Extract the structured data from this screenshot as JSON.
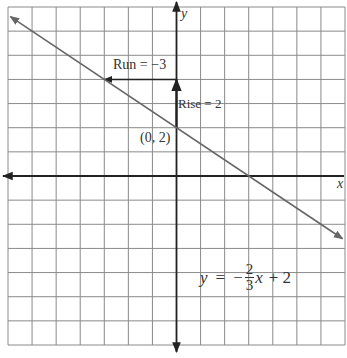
{
  "diagram": {
    "type": "coordinate-graph",
    "grid": {
      "x_min": -7,
      "x_max": 7,
      "y_min": -7,
      "y_max": 7,
      "step": 1
    },
    "axes": {
      "x_label": "x",
      "y_label": "y"
    },
    "line": {
      "slope_num": -2,
      "slope_den": 3,
      "intercept": 2,
      "color": "#666666"
    },
    "point": {
      "label": "(0, 2)",
      "x": 0,
      "y": 2
    },
    "rise": {
      "label": "Rise = 2",
      "from": [
        0,
        2
      ],
      "to": [
        0,
        4
      ]
    },
    "run": {
      "label": "Run = −3",
      "from": [
        0,
        4
      ],
      "to": [
        -3,
        4
      ]
    },
    "equation": {
      "lhs": "y",
      "eq": "=",
      "sign": "−",
      "num": "2",
      "den": "3",
      "var": "x",
      "rest": "+ 2"
    }
  },
  "colors": {
    "grid": "#8a8a8a",
    "axis": "#222222",
    "line": "#666666",
    "text": "#333333"
  }
}
